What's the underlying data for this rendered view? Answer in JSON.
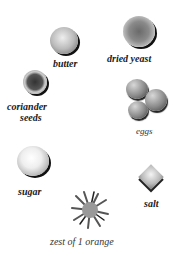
{
  "ingredients": [
    {
      "name": "butter",
      "label": "butter"
    },
    {
      "name": "dried-yeast",
      "label": "dried yeast"
    },
    {
      "name": "coriander-seeds",
      "label_line1": "coriander",
      "label_line2": "seeds"
    },
    {
      "name": "eggs",
      "label": "eggs"
    },
    {
      "name": "sugar",
      "label": "sugar"
    },
    {
      "name": "salt",
      "label": "salt"
    },
    {
      "name": "orange-zest",
      "label": "zest of 1 orange"
    }
  ]
}
